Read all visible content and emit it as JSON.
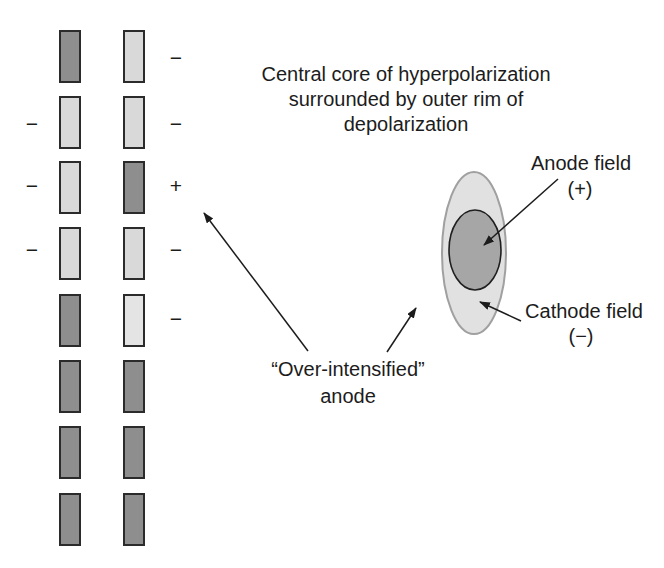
{
  "figure": {
    "description_role": "textbook-figure"
  },
  "colors": {
    "background": "#ffffff",
    "rect_dark_fill": "#8e8e8e",
    "rect_light_fill": "#d9d9d9",
    "rect_lighter_fill": "#e4e4e4",
    "rect_border": "#2b2b2b",
    "outer_ellipse_fill": "#e1e1e1",
    "outer_ellipse_border": "#a0a0a0",
    "inner_ellipse_fill": "#a6a6a6",
    "inner_ellipse_border": "#1f1f1f",
    "text": "#1c1c1c",
    "arrow": "#1c1c1c"
  },
  "caption": {
    "line1": "Central core of hyperpolarization",
    "line2": "surrounded by outer rim of",
    "line3": "depolarization"
  },
  "labels": {
    "anode_field": {
      "line1": "Anode field",
      "line2": "(+)"
    },
    "cathode_field": {
      "line1": "Cathode field",
      "line2": "(−)"
    },
    "over_intensified": {
      "line1": "“Over-intensified”",
      "line2": "anode"
    }
  },
  "electrode_grid": {
    "col_x": [
      60,
      124
    ],
    "rect_width": 20,
    "rect_height": 51,
    "left_sign_x": 32,
    "right_sign_x": 176,
    "rows": [
      {
        "top": 31,
        "left_shade": "dark",
        "right_shade": "light",
        "left_sign": "",
        "right_sign": "−",
        "sign_y": 57
      },
      {
        "top": 97,
        "left_shade": "light",
        "right_shade": "light",
        "left_sign": "−",
        "right_sign": "−",
        "sign_y": 123
      },
      {
        "top": 162,
        "left_shade": "light",
        "right_shade": "dark",
        "left_sign": "−",
        "right_sign": "+",
        "sign_y": 185
      },
      {
        "top": 228,
        "left_shade": "light",
        "right_shade": "light",
        "left_sign": "−",
        "right_sign": "−",
        "sign_y": 249
      },
      {
        "top": 295,
        "left_shade": "dark",
        "right_shade": "lighter",
        "left_sign": "",
        "right_sign": "−",
        "sign_y": 318
      },
      {
        "top": 361,
        "left_shade": "dark",
        "right_shade": "dark",
        "left_sign": "",
        "right_sign": "",
        "sign_y": 0
      },
      {
        "top": 427,
        "left_shade": "dark",
        "right_shade": "dark",
        "left_sign": "",
        "right_sign": "",
        "sign_y": 0
      },
      {
        "top": 494,
        "left_shade": "dark",
        "right_shade": "dark",
        "left_sign": "",
        "right_sign": "",
        "sign_y": 0
      }
    ]
  },
  "field_diagram": {
    "outer_ellipse": {
      "cx": 474,
      "cy": 253,
      "rx": 32,
      "ry": 81
    },
    "inner_ellipse": {
      "cx": 475,
      "cy": 250,
      "rx": 26,
      "ry": 40
    }
  },
  "arrows": [
    {
      "name": "anode-field-arrow",
      "x1": 558,
      "y1": 179,
      "x2": 484,
      "y2": 245
    },
    {
      "name": "cathode-field-arrow",
      "x1": 521,
      "y1": 321,
      "x2": 480,
      "y2": 302
    },
    {
      "name": "over-intensified-left-arrow",
      "x1": 308,
      "y1": 351,
      "x2": 204,
      "y2": 213
    },
    {
      "name": "over-intensified-right-arrow",
      "x1": 387,
      "y1": 352,
      "x2": 416,
      "y2": 308
    }
  ]
}
